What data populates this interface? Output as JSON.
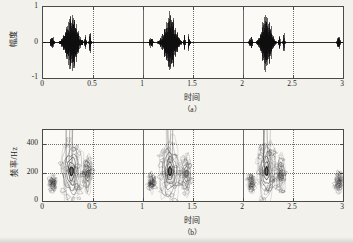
{
  "figure": {
    "background_color": "#f3f1ec",
    "ink_color": "#1a1a1a",
    "panels": [
      {
        "id": "a",
        "caption": "（a）",
        "xlabel": "时间",
        "ylabel": "幅度"
      },
      {
        "id": "b",
        "caption": "（b）",
        "xlabel": "时间",
        "ylabel": "频率/Hz"
      }
    ]
  },
  "panel_a": {
    "caption": "（a）",
    "xlabel": "时间",
    "ylabel": "幅度",
    "yticks": [
      "1",
      "0",
      "-1"
    ],
    "xticks": [
      "0",
      "0.5",
      "1",
      "1.5",
      "2",
      "2.5",
      "3"
    ]
  },
  "panel_b": {
    "caption": "（b）",
    "xlabel": "时间",
    "ylabel": "频率/Hz",
    "yticks": [
      "400",
      "200",
      "0"
    ],
    "xticks": [
      "0",
      "0.5",
      "1",
      "1.5",
      "2",
      "2.5",
      "3"
    ]
  },
  "chart_data": [
    {
      "type": "line",
      "id": "waveform",
      "title": "（a）",
      "xlabel": "时间",
      "ylabel": "幅度",
      "xlim": [
        0,
        3
      ],
      "ylim": [
        -1,
        1
      ],
      "xticks": [
        0,
        0.5,
        1,
        1.5,
        2,
        2.5,
        3
      ],
      "yticks": [
        -1,
        0,
        1
      ],
      "grid": "vertical-dotted-at-xticks",
      "legend": "none",
      "series": [
        {
          "name": "speech amplitude",
          "description": "Time-domain speech waveform: three near-identical repetitions of an utterance, each about 0.45 s long and starting 1 s apart, plus a short isolated burst near t = 2.95 s. Baseline is flat (zero) between bursts.",
          "bursts": [
            {
              "start": 0.06,
              "end": 0.12,
              "peak": 0.22,
              "label": "onset-burst-1"
            },
            {
              "start": 0.17,
              "end": 0.4,
              "peak": 0.95,
              "label": "main-voiced-segment-1"
            },
            {
              "start": 0.41,
              "end": 0.44,
              "peak": 0.3,
              "label": "tail-burst-1a"
            },
            {
              "start": 0.455,
              "end": 0.485,
              "peak": 0.33,
              "label": "tail-burst-1b"
            },
            {
              "start": 1.05,
              "end": 1.11,
              "peak": 0.22,
              "label": "onset-burst-2"
            },
            {
              "start": 1.16,
              "end": 1.38,
              "peak": 1.0,
              "label": "main-voiced-segment-2"
            },
            {
              "start": 1.4,
              "end": 1.43,
              "peak": 0.3,
              "label": "tail-burst-2a"
            },
            {
              "start": 1.445,
              "end": 1.475,
              "peak": 0.33,
              "label": "tail-burst-2b"
            },
            {
              "start": 2.05,
              "end": 2.11,
              "peak": 0.22,
              "label": "onset-burst-3"
            },
            {
              "start": 2.14,
              "end": 2.33,
              "peak": 0.93,
              "label": "main-voiced-segment-3"
            },
            {
              "start": 2.35,
              "end": 2.38,
              "peak": 0.3,
              "label": "tail-burst-3a"
            },
            {
              "start": 2.395,
              "end": 2.425,
              "peak": 0.33,
              "label": "tail-burst-3b"
            },
            {
              "start": 2.93,
              "end": 2.98,
              "peak": 0.26,
              "label": "isolated-burst-4"
            }
          ]
        }
      ]
    },
    {
      "type": "heatmap",
      "id": "spectrogram",
      "title": "（b）",
      "xlabel": "时间",
      "ylabel": "频率/Hz",
      "xlim": [
        0,
        3
      ],
      "ylim": [
        0,
        500
      ],
      "xticks": [
        0,
        0.5,
        1,
        1.5,
        2,
        2.5,
        3
      ],
      "yticks": [
        0,
        200,
        400
      ],
      "grid": "dotted at y=200,400 and solid/dotted at xticks",
      "legend": "none",
      "rendering": "grayscale contour lines (no filled colormap)",
      "energy_regions": [
        {
          "t_start": 0.06,
          "t_end": 0.13,
          "f_low": 60,
          "f_high": 190,
          "intensity": 0.45,
          "label": "region-1-onset"
        },
        {
          "t_start": 0.17,
          "t_end": 0.4,
          "f_low": 40,
          "f_high": 500,
          "f_peak": 210,
          "intensity": 1.0,
          "label": "region-1-main"
        },
        {
          "t_start": 0.4,
          "t_end": 0.49,
          "f_low": 50,
          "f_high": 330,
          "intensity": 0.55,
          "label": "region-1-tail"
        },
        {
          "t_start": 1.05,
          "t_end": 1.12,
          "f_low": 60,
          "f_high": 190,
          "intensity": 0.45,
          "label": "region-2-onset"
        },
        {
          "t_start": 1.16,
          "t_end": 1.38,
          "f_low": 40,
          "f_high": 500,
          "f_peak": 210,
          "intensity": 1.0,
          "label": "region-2-main"
        },
        {
          "t_start": 1.38,
          "t_end": 1.48,
          "f_low": 50,
          "f_high": 330,
          "intensity": 0.55,
          "label": "region-2-tail"
        },
        {
          "t_start": 2.05,
          "t_end": 2.12,
          "f_low": 60,
          "f_high": 190,
          "intensity": 0.45,
          "label": "region-3-onset"
        },
        {
          "t_start": 2.14,
          "t_end": 2.33,
          "f_low": 40,
          "f_high": 500,
          "f_peak": 210,
          "intensity": 1.0,
          "label": "region-3-main"
        },
        {
          "t_start": 2.33,
          "t_end": 2.43,
          "f_low": 50,
          "f_high": 330,
          "intensity": 0.55,
          "label": "region-3-tail"
        },
        {
          "t_start": 2.92,
          "t_end": 3.0,
          "f_low": 60,
          "f_high": 210,
          "intensity": 0.5,
          "label": "region-4-isolated"
        }
      ]
    }
  ]
}
